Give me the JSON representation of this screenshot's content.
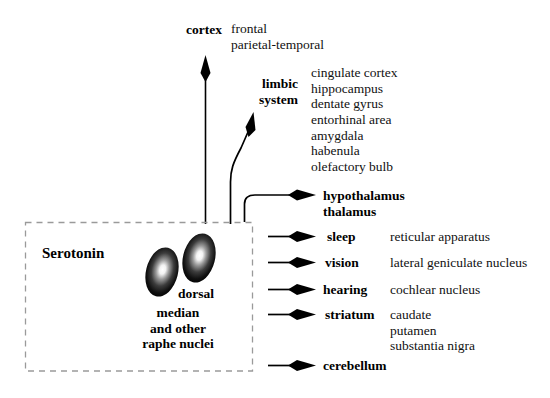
{
  "diagram": {
    "source_box": {
      "label": "Serotonin",
      "nuclei": [
        {
          "name": "median",
          "label": "median"
        },
        {
          "name": "dorsal",
          "label": "dorsal"
        }
      ],
      "caption": "median\nand other\nraphe nuclei",
      "caption_lines": [
        "median",
        "and other",
        "raphe nuclei"
      ],
      "dorsal_label": "dorsal",
      "border_style": "dashed"
    },
    "projections": [
      {
        "id": "cortex",
        "target": "cortex",
        "detail": "frontal\nparietal-temporal",
        "detail_lines": [
          "frontal",
          "parietal-temporal"
        ],
        "arrow": "up-vertical"
      },
      {
        "id": "limbic-system",
        "target": "limbic\nsystem",
        "target_lines": [
          "limbic",
          "system"
        ],
        "detail": "cingulate cortex\nhippocampus\n   dentate gyrus\n    entorhinal area\namygdala\nhabenula\nolefactory bulb",
        "detail_lines": [
          "cingulate cortex",
          "hippocampus",
          "dentate gyrus",
          "entorhinal area",
          "amygdala",
          "habenula",
          "olefactory bulb"
        ],
        "arrow": "up-right-curve"
      },
      {
        "id": "hypothalamus-thalamus",
        "target": "hypothalamus\nthalamus",
        "target_lines": [
          "hypothalamus",
          "thalamus"
        ],
        "detail": "",
        "arrow": "curve-right"
      },
      {
        "id": "sleep",
        "target": "sleep",
        "detail": "reticular apparatus",
        "arrow": "right"
      },
      {
        "id": "vision",
        "target": "vision",
        "detail": "lateral geniculate nucleus",
        "arrow": "right"
      },
      {
        "id": "hearing",
        "target": "hearing",
        "detail": "cochlear nucleus",
        "arrow": "right"
      },
      {
        "id": "striatum",
        "target": "striatum",
        "detail": "caudate\nputamen\nsubstantia nigra",
        "detail_lines": [
          "caudate",
          "putamen",
          "substantia nigra"
        ],
        "arrow": "right"
      },
      {
        "id": "cerebellum",
        "target": "cerebellum",
        "detail": "",
        "arrow": "right"
      }
    ],
    "colors": {
      "ink": "#000000",
      "text": "#111111",
      "background": "#ffffff",
      "box_border": "#9a9a9a",
      "nucleus_core": "#ffffff",
      "nucleus_edge": "#000000"
    }
  }
}
